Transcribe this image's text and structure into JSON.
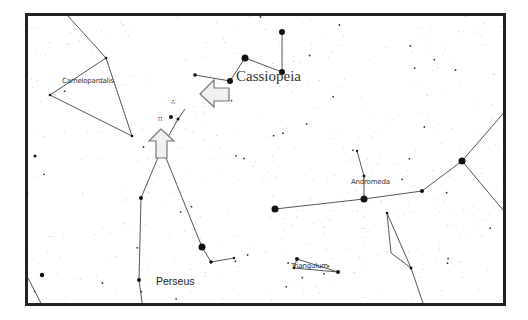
{
  "chart": {
    "frame_color": "#222222",
    "line_color": "#555555",
    "star_color": "#111111",
    "arrow_fill": "#f0f0f0",
    "arrow_stroke": "#777777"
  },
  "labels": {
    "camelopardalis": "Camelopardalis",
    "cassiopeia": "Cassiopeia",
    "andromeda": "Andromeda",
    "perseus": "Perseus",
    "triangulum": "Triangulum"
  },
  "objects": {
    "cluster_a": "∴",
    "cluster_b": "∷"
  },
  "constellations": [
    {
      "name": "Camelopardalis",
      "lines": [
        [
          [
            40,
            0
          ],
          [
            78,
            42
          ],
          [
            104,
            120
          ]
        ],
        [
          [
            78,
            42
          ],
          [
            22,
            79
          ],
          [
            104,
            120
          ]
        ]
      ]
    },
    {
      "name": "Cassiopeia",
      "lines": [
        [
          [
            167,
            59
          ],
          [
            202,
            65
          ],
          [
            217,
            42
          ],
          [
            254,
            56
          ],
          [
            254,
            16
          ]
        ]
      ]
    },
    {
      "name": "Perseus",
      "lines": [
        [
          [
            134,
            132
          ],
          [
            150,
            103
          ],
          [
            157,
            93
          ]
        ],
        [
          [
            134,
            132
          ],
          [
            113,
            182
          ],
          [
            111,
            264
          ],
          [
            115,
            293
          ]
        ],
        [
          [
            134,
            132
          ],
          [
            174,
            231
          ],
          [
            183,
            246
          ],
          [
            206,
            242
          ]
        ]
      ]
    },
    {
      "name": "Andromeda",
      "lines": [
        [
          [
            247,
            193
          ],
          [
            336,
            183
          ],
          [
            394,
            175
          ],
          [
            434,
            145
          ],
          [
            480,
            92
          ]
        ],
        [
          [
            434,
            145
          ],
          [
            480,
            200
          ]
        ],
        [
          [
            336,
            183
          ],
          [
            336,
            160
          ],
          [
            329,
            135
          ]
        ]
      ]
    },
    {
      "name": "Triangulum",
      "lines": [
        [
          [
            269,
            243
          ],
          [
            310,
            256
          ],
          [
            266,
            252
          ],
          [
            269,
            243
          ]
        ]
      ]
    },
    {
      "name": "Pisces",
      "lines": [
        [
          [
            359,
            197
          ],
          [
            363,
            237
          ],
          [
            383,
            252
          ],
          [
            397,
            293
          ]
        ],
        [
          [
            359,
            197
          ],
          [
            383,
            252
          ]
        ]
      ]
    },
    {
      "name": "Lacerta-corner",
      "lines": [
        [
          [
            0,
            262
          ],
          [
            16,
            293
          ]
        ]
      ]
    }
  ],
  "bright_stars": [
    [
      217,
      42,
      3.5
    ],
    [
      254,
      16,
      3
    ],
    [
      202,
      65,
      3
    ],
    [
      254,
      56,
      3
    ],
    [
      167,
      59,
      1.8
    ],
    [
      134,
      132,
      3.5
    ],
    [
      174,
      231,
      3.5
    ],
    [
      113,
      182,
      2
    ],
    [
      111,
      264,
      2
    ],
    [
      143,
      101,
      2
    ],
    [
      150,
      103,
      1.5
    ],
    [
      183,
      246,
      1.8
    ],
    [
      206,
      242,
      1.2
    ],
    [
      247,
      193,
      3.5
    ],
    [
      336,
      183,
      3.5
    ],
    [
      394,
      175,
      2
    ],
    [
      434,
      145,
      3.5
    ],
    [
      329,
      135,
      1.2
    ],
    [
      336,
      160,
      1.5
    ],
    [
      269,
      243,
      2
    ],
    [
      310,
      256,
      2
    ],
    [
      266,
      252,
      1.3
    ],
    [
      78,
      42,
      1.3
    ],
    [
      22,
      79,
      1.3
    ],
    [
      104,
      120,
      1.3
    ],
    [
      359,
      197,
      1.3
    ],
    [
      383,
      252,
      1.5
    ],
    [
      14,
      259,
      2.2
    ],
    [
      9,
      292,
      2
    ],
    [
      16,
      293,
      1.5
    ],
    [
      7,
      140,
      1.5
    ]
  ],
  "arrows": [
    {
      "direction": "left",
      "points": "172,78 186,64 186,72 201,72 201,85 186,85 186,91"
    },
    {
      "direction": "up",
      "points": "133,113 121,125 128,125 128,142 139,142 139,125 146,125"
    }
  ]
}
